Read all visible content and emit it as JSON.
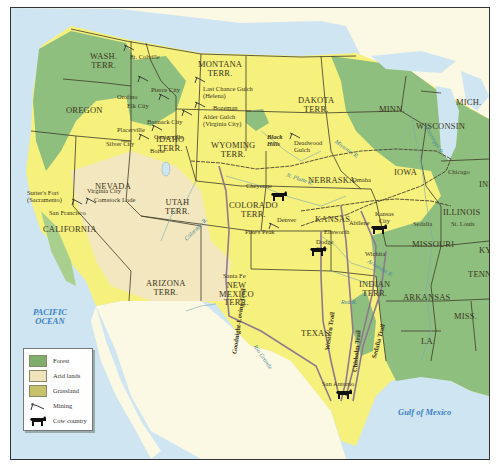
{
  "map": {
    "title": "Western United States: Mining, Cattle Trails and Land Cover",
    "colors": {
      "forest": "#8fbf7e",
      "arid": "#f3e7bf",
      "grassland": "#f6f07c",
      "ocean": "#cfe6f2",
      "foreign_land": "#fbf8e4",
      "trail": "#8e7a8c",
      "railroad": "#4a4030"
    },
    "territories": [
      {
        "id": "wash",
        "label": "WASH.\nTERR."
      },
      {
        "id": "oregon",
        "label": "OREGON"
      },
      {
        "id": "california",
        "label": "CALIFORNIA"
      },
      {
        "id": "nevada",
        "label": "NEVADA"
      },
      {
        "id": "idaho",
        "label": "IDAHO\nTERR."
      },
      {
        "id": "montana",
        "label": "MONTANA\nTERR."
      },
      {
        "id": "wyoming",
        "label": "WYOMING\nTERR."
      },
      {
        "id": "utah",
        "label": "UTAH\nTERR."
      },
      {
        "id": "colorado",
        "label": "COLORADO\nTERR."
      },
      {
        "id": "arizona",
        "label": "ARIZONA\nTERR."
      },
      {
        "id": "new_mexico",
        "label": "NEW\nMEXICO\nTERR."
      },
      {
        "id": "dakota",
        "label": "DAKOTA\nTERR."
      },
      {
        "id": "nebraska",
        "label": "NEBRASKA"
      },
      {
        "id": "kansas",
        "label": "KANSAS"
      },
      {
        "id": "indian",
        "label": "INDIAN\nTERR."
      },
      {
        "id": "texas",
        "label": "TEXAS"
      },
      {
        "id": "minn",
        "label": "MINN."
      },
      {
        "id": "wisconsin",
        "label": "WISCONSIN"
      },
      {
        "id": "mich",
        "label": "MICH."
      },
      {
        "id": "iowa",
        "label": "IOWA"
      },
      {
        "id": "illinois",
        "label": "ILLINOIS"
      },
      {
        "id": "ind",
        "label": "IND."
      },
      {
        "id": "missouri",
        "label": "MISSOURI"
      },
      {
        "id": "ky",
        "label": "KY."
      },
      {
        "id": "tenn",
        "label": "TENN."
      },
      {
        "id": "arkansas",
        "label": "ARKANSAS"
      },
      {
        "id": "miss",
        "label": "MISS."
      },
      {
        "id": "la",
        "label": "LA."
      }
    ],
    "places": [
      {
        "id": "ft_colville",
        "label": "Ft. Colville"
      },
      {
        "id": "pierce_city",
        "label": "Pierce City"
      },
      {
        "id": "orofino",
        "label": "Orofino"
      },
      {
        "id": "elk_city",
        "label": "Elk City"
      },
      {
        "id": "last_chance",
        "label": "Last Chance Gulch\n(Helena)"
      },
      {
        "id": "bozeman",
        "label": "Bozeman"
      },
      {
        "id": "alder_gulch",
        "label": "Alder Gulch\n(Virginia City)"
      },
      {
        "id": "bannack",
        "label": "Bannack City"
      },
      {
        "id": "placerville",
        "label": "Placerville"
      },
      {
        "id": "centerville",
        "label": "Centerville"
      },
      {
        "id": "silver_city",
        "label": "Silver City"
      },
      {
        "id": "boise",
        "label": "Boise"
      },
      {
        "id": "deadwood",
        "label": "Deadwood\nGulch"
      },
      {
        "id": "black_hills",
        "label": "Black\nHills"
      },
      {
        "id": "sutters_fort",
        "label": "Sutter's Fort\n(Sacramento)"
      },
      {
        "id": "virginia_city_nv",
        "label": "Virginia City"
      },
      {
        "id": "comstock",
        "label": "Comstock Lode"
      },
      {
        "id": "san_francisco",
        "label": "San Francisco"
      },
      {
        "id": "cheyenne",
        "label": "Cheyenne"
      },
      {
        "id": "omaha",
        "label": "Omaha"
      },
      {
        "id": "chicago",
        "label": "Chicago"
      },
      {
        "id": "denver",
        "label": "Denver"
      },
      {
        "id": "pikes_peak",
        "label": "Pike's Peak"
      },
      {
        "id": "kansas_city",
        "label": "Kansas\nCity"
      },
      {
        "id": "abilene",
        "label": "Abilene"
      },
      {
        "id": "ellsworth",
        "label": "Ellsworth"
      },
      {
        "id": "dodge_city",
        "label": "Dodge\nCity"
      },
      {
        "id": "wichita",
        "label": "Wichita"
      },
      {
        "id": "sedalia",
        "label": "Sedalia"
      },
      {
        "id": "st_louis",
        "label": "St. Louis"
      },
      {
        "id": "santa_fe",
        "label": "Santa Fe"
      },
      {
        "id": "san_antonio",
        "label": "San Antonio"
      }
    ],
    "rivers": [
      {
        "id": "platte",
        "label": "N. Platte R."
      },
      {
        "id": "missouri_r",
        "label": "Missouri R."
      },
      {
        "id": "mississippi",
        "label": "Mississippi R."
      },
      {
        "id": "colorado_r",
        "label": "Colorado R."
      },
      {
        "id": "rio_grande",
        "label": "Rio Grande"
      },
      {
        "id": "red_r",
        "label": "Red R."
      },
      {
        "id": "arkansas_r",
        "label": "Arkansas R."
      }
    ],
    "trails": [
      {
        "id": "goodnight",
        "label": "Goodnight-Loving Trail"
      },
      {
        "id": "western",
        "label": "Western Trail"
      },
      {
        "id": "chisholm",
        "label": "Chisholm Trail"
      },
      {
        "id": "sedalia_t",
        "label": "Sedalia Trail"
      }
    ],
    "water_bodies": [
      {
        "id": "pacific",
        "label": "PACIFIC\nOCEAN"
      },
      {
        "id": "gulf",
        "label": "Gulf of Mexico"
      }
    ]
  },
  "legend": {
    "items": [
      {
        "label": "Forest",
        "symbol": "forest-swatch",
        "color": "#7fae6c"
      },
      {
        "label": "Arid lands",
        "symbol": "arid-swatch",
        "color": "#f1e4bb"
      },
      {
        "label": "Grassland",
        "symbol": "grassland-swatch",
        "color": "#c8c26a"
      },
      {
        "label": "Mining",
        "symbol": "pickaxe-icon"
      },
      {
        "label": "Cow country",
        "symbol": "cow-icon"
      }
    ]
  }
}
